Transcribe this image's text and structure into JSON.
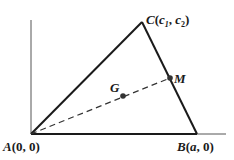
{
  "diagram": {
    "type": "geometry-triangle",
    "colors": {
      "stroke": "#1a1a1a",
      "axis": "#555555",
      "point": "#333333",
      "background": "#ffffff"
    },
    "axes": {
      "origin": [
        31,
        134
      ],
      "y_axis_top": [
        31,
        20
      ],
      "x_axis_end": [
        226,
        134
      ]
    },
    "vertices": {
      "A": {
        "name": "A",
        "coords": "(0, 0)",
        "px": [
          31,
          134
        ]
      },
      "B": {
        "name": "B",
        "coords_open": "(",
        "coord_var": "a",
        "coords_close": ", 0)",
        "px": [
          197,
          134
        ]
      },
      "C": {
        "name": "C",
        "open": "(",
        "c": "c",
        "sub1": "1",
        "comma": ", ",
        "sub2": "2",
        "close": ")",
        "px": [
          142,
          22
        ]
      }
    },
    "points": {
      "M": {
        "name": "M",
        "px": [
          170,
          78
        ],
        "description": "midpoint of BC"
      },
      "G": {
        "name": "G",
        "px": [
          123,
          96
        ],
        "description": "centroid on median AM"
      }
    },
    "segments": [
      {
        "from": "A",
        "to": "B",
        "style": "solid"
      },
      {
        "from": "B",
        "to": "C",
        "style": "solid"
      },
      {
        "from": "C",
        "to": "A",
        "style": "solid"
      },
      {
        "from": "A",
        "to": "M",
        "style": "dashed"
      }
    ]
  }
}
